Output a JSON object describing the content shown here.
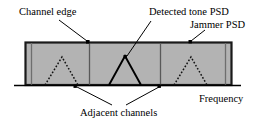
{
  "figure": {
    "name": "jammer-psd-spectrum-diagram",
    "type": "schematic-spectrum-diagram",
    "background_color": "#ffffff",
    "band_fill_color": "#b3b3b3",
    "band_border_color": "#1a1a1a",
    "line_color": "#000000"
  },
  "labels": {
    "channel_edge": "Channel edge",
    "detected_tone_psd": "Detected tone PSD",
    "jammer_psd": "Jammer PSD",
    "frequency": "Frequency",
    "adjacent_channels": "Adjacent channels"
  },
  "diagram_data": {
    "type": "schematic",
    "axis": {
      "name": "Frequency",
      "orientation": "horizontal",
      "baseline_y": 85,
      "x_start": 14,
      "x_end": 241
    },
    "jammer_band": {
      "label": "Jammer PSD",
      "x_left": 25,
      "x_right": 232,
      "y_top": 42,
      "y_bottom": 85,
      "fill": "#b3b3b3",
      "stroke": "#1a1a1a"
    },
    "channel_edges": [
      {
        "x": 31,
        "label": "Channel edge"
      },
      {
        "x": 89,
        "label": "Channel edge"
      },
      {
        "x": 160,
        "label": "Channel edge"
      },
      {
        "x": 225,
        "label": "Channel edge"
      }
    ],
    "tones": [
      {
        "name": "adjacent-channel-tone-left",
        "style": "dotted",
        "left_foot_x": 45,
        "peak_x": 62,
        "peak_y": 57,
        "right_foot_x": 78
      },
      {
        "name": "detected-tone",
        "style": "solid",
        "left_foot_x": 109,
        "peak_x": 125,
        "peak_y": 56,
        "right_foot_x": 141
      },
      {
        "name": "adjacent-channel-tone-right",
        "style": "dotted",
        "left_foot_x": 174,
        "peak_x": 191,
        "peak_y": 57,
        "right_foot_x": 207
      }
    ],
    "annotations": [
      {
        "name": "channel-edge-pointer",
        "text": "Channel edge",
        "from": [
          59,
          20
        ],
        "to": [
          89,
          43
        ]
      },
      {
        "name": "detected-tone-pointer",
        "text": "Detected tone PSD",
        "from": [
          151,
          21
        ],
        "to": [
          126,
          57
        ]
      },
      {
        "name": "jammer-psd-pointer",
        "text": "Jammer PSD",
        "from": [
          204,
          30
        ],
        "to": [
          190,
          42
        ]
      },
      {
        "name": "adjacent-channels-pointer-left",
        "text": "Adjacent channels",
        "from": [
          112,
          106
        ],
        "to": [
          75,
          86
        ]
      },
      {
        "name": "adjacent-channels-pointer-right",
        "text": "Adjacent channels",
        "from": [
          126,
          106
        ],
        "to": [
          160,
          86
        ]
      }
    ]
  }
}
